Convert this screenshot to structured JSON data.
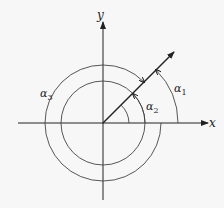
{
  "diagram": {
    "axis_labels": {
      "x": "x",
      "y": "y"
    },
    "angle_labels": {
      "alpha1": "α",
      "alpha1_sub": "1",
      "alpha2": "α",
      "alpha2_sub": "2",
      "alpha3": "α",
      "alpha3_sub": "3"
    },
    "colors": {
      "stroke": "#222222",
      "background": "#f7f7f7"
    }
  }
}
